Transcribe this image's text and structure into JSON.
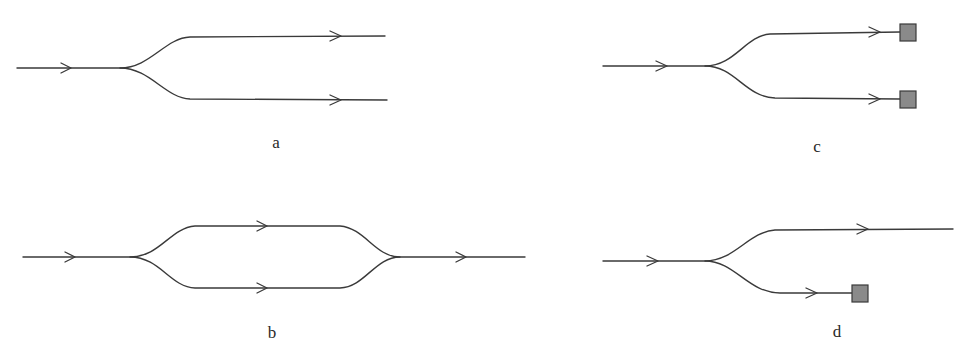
{
  "figure": {
    "panels": [
      {
        "id": "a",
        "label": "a",
        "description": "Y-splitter: one input splits into two outputs",
        "input_arrows": 1,
        "output_arrows": 2,
        "terminations": 0
      },
      {
        "id": "b",
        "label": "b",
        "description": "Mach-Zehnder: input splits into two arms that recombine into one output",
        "input_arrows": 1,
        "arm_arrows": 2,
        "output_arrows": 1,
        "terminations": 0
      },
      {
        "id": "c",
        "label": "c",
        "description": "Y-splitter with both output arms terminated",
        "input_arrows": 1,
        "output_arrows": 2,
        "terminations": 2
      },
      {
        "id": "d",
        "label": "d",
        "description": "Y-splitter with upper arm as output and lower arm terminated",
        "input_arrows": 1,
        "output_arrows": 2,
        "terminations": 1
      }
    ],
    "colors": {
      "line": "#3a3a3a",
      "termination_fill": "#8a8a8a",
      "background": "#ffffff"
    }
  }
}
